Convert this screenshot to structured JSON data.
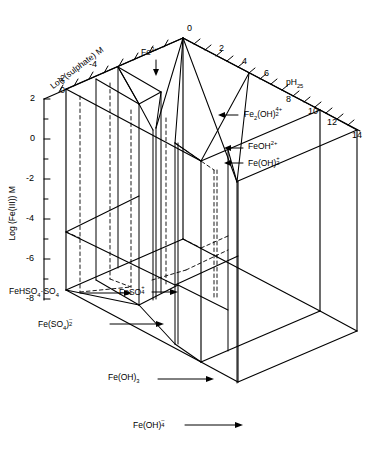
{
  "figure": {
    "background_color": "#ffffff",
    "line_color": "#000000",
    "dashed_color": "#000000"
  },
  "axes": {
    "sulphate": {
      "label": "Log (sulphate) M",
      "ticks": [
        "0",
        "-2",
        "-4"
      ],
      "direction": "up-right-diagonal"
    },
    "ph": {
      "label": "pH",
      "label_sub": "25",
      "ticks": [
        "0",
        "2",
        "4",
        "6",
        "8",
        "10",
        "12",
        "14"
      ],
      "direction": "down-right-diagonal"
    },
    "iron": {
      "label": "Log (Fe(III)) M",
      "ticks": [
        "2",
        "0",
        "-2",
        "-4",
        "-6",
        "-8"
      ],
      "direction": "vertical"
    }
  },
  "species": [
    {
      "id": "fe3",
      "text": "Fe",
      "sup": "3+",
      "marker": "down-arrow"
    },
    {
      "id": "fe2oh2",
      "text": "Fe",
      "sub": "2",
      "mid": "(OH)",
      "updown_sup": "4+",
      "updown_sub": "2",
      "marker": "left-arrow"
    },
    {
      "id": "feoh2plus",
      "text": "FeOH",
      "sup": "2+",
      "marker": "left-arrow"
    },
    {
      "id": "feoh2",
      "text": "Fe(OH)",
      "updown_sup": "+",
      "updown_sub": "2",
      "marker": "left-arrow"
    },
    {
      "id": "fehso4so4",
      "text": "FeHSO",
      "sub": "4",
      "mid": "·SO",
      "sub2": "4",
      "marker": "right-arrow"
    },
    {
      "id": "feso4",
      "text": "FeSO",
      "updown_sup": "+",
      "updown_sub": "4",
      "marker": "right-arrow"
    },
    {
      "id": "feso42",
      "text": "Fe(SO",
      "sub": "4",
      "mid": ")",
      "overbar_sub": "2",
      "marker": "right-arrow"
    },
    {
      "id": "feoh3",
      "text": "Fe(OH)",
      "sub": "3",
      "marker": "right-arrow"
    },
    {
      "id": "feoh4",
      "text": "Fe(OH)",
      "overbar_sub": "4",
      "marker": "right-arrow"
    }
  ],
  "labels": {
    "sulphate_axis": "Log (sulphate) M",
    "iron_axis": "Log (Fe(III)) M",
    "ph_axis": "pH",
    "ph_axis_sub": "25",
    "sulphate_tick_0": "0",
    "sulphate_tick_m2": "-2",
    "sulphate_tick_m4": "-4",
    "ph_tick_0": "0",
    "ph_tick_2": "2",
    "ph_tick_4": "4",
    "ph_tick_6": "6",
    "ph_tick_8": "8",
    "ph_tick_10": "10",
    "ph_tick_12": "12",
    "ph_tick_14": "14",
    "iron_tick_2": "2",
    "iron_tick_0": "0",
    "iron_tick_m2": "-2",
    "iron_tick_m4": "-4",
    "iron_tick_m6": "-6",
    "iron_tick_m8": "-8"
  }
}
